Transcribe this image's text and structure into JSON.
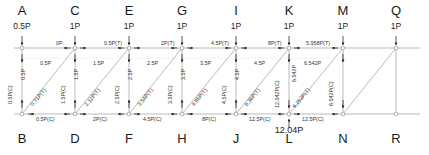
{
  "diagram": {
    "type": "truss-force-diagram",
    "panel_width": 53.5,
    "top_chord_y": 48,
    "bottom_chord_y": 114,
    "colors": {
      "member": "#9a9a9a",
      "text": "#2b2b2b",
      "arrow": "#222222"
    }
  },
  "top_nodes": [
    {
      "id": "A",
      "letter": "A",
      "load": "0.5P",
      "x": 22
    },
    {
      "id": "C",
      "letter": "C",
      "load": "1P",
      "x": 75
    },
    {
      "id": "E",
      "letter": "E",
      "load": "1P",
      "x": 129
    },
    {
      "id": "G",
      "letter": "G",
      "load": "1P",
      "x": 182
    },
    {
      "id": "I",
      "letter": "I",
      "load": "1P",
      "x": 236
    },
    {
      "id": "K",
      "letter": "K",
      "load": "1P",
      "x": 289
    },
    {
      "id": "M",
      "letter": "M",
      "load": "1P",
      "x": 343
    },
    {
      "id": "Q",
      "letter": "Q",
      "load": "1P",
      "x": 396
    }
  ],
  "bottom_nodes": [
    {
      "id": "B",
      "letter": "B",
      "x": 22
    },
    {
      "id": "D",
      "letter": "D",
      "x": 75
    },
    {
      "id": "F",
      "letter": "F",
      "x": 129
    },
    {
      "id": "H",
      "letter": "H",
      "x": 182
    },
    {
      "id": "J",
      "letter": "J",
      "x": 236
    },
    {
      "id": "L",
      "letter": "L",
      "x": 289
    },
    {
      "id": "N",
      "letter": "N",
      "x": 343
    },
    {
      "id": "R",
      "letter": "R",
      "x": 396
    }
  ],
  "top_chord_forces": [
    {
      "from": "A",
      "to": "C",
      "label": "0P",
      "x": 56,
      "y": 43
    },
    {
      "from": "C",
      "to": "E",
      "label": "0.5P(T)",
      "x": 107,
      "y": 43
    },
    {
      "from": "E",
      "to": "G",
      "label": "2P(T)",
      "x": 163,
      "y": 43
    },
    {
      "from": "G",
      "to": "I",
      "label": "4.5P(T)",
      "x": 213,
      "y": 43
    },
    {
      "from": "I",
      "to": "K",
      "label": "8P(T)",
      "x": 268,
      "y": 43
    },
    {
      "from": "K",
      "to": "M",
      "label": "5.958P(T)",
      "x": 313,
      "y": 43
    }
  ],
  "bottom_chord_forces": [
    {
      "from": "B",
      "to": "D",
      "label": "0.5P(C)",
      "x": 54,
      "y": 117
    },
    {
      "from": "D",
      "to": "F",
      "label": "2P(C)",
      "x": 110,
      "y": 117
    },
    {
      "from": "F",
      "to": "H",
      "label": "4.5P(C)",
      "x": 160,
      "y": 117
    },
    {
      "from": "H",
      "to": "J",
      "label": "8P(C)",
      "x": 216,
      "y": 117
    },
    {
      "from": "J",
      "to": "L",
      "label": "12.5P(C)",
      "x": 256,
      "y": 117
    },
    {
      "from": "L",
      "to": "N",
      "label": "12.5P(C)",
      "x": 310,
      "y": 117
    }
  ],
  "vertical_forces": [
    {
      "from": "A",
      "to": "B",
      "label": "0.5P(C)",
      "x": 11,
      "y": 103
    },
    {
      "from": "C",
      "to": "D",
      "label": "1.5P(C)",
      "x": 65,
      "y": 103
    },
    {
      "from": "E",
      "to": "F",
      "label": "2.5P(C)",
      "x": 118,
      "y": 103
    },
    {
      "from": "G",
      "to": "H",
      "label": "3.5P(C)",
      "x": 172,
      "y": 103
    },
    {
      "from": "I",
      "to": "J",
      "label": "4.5P(C)",
      "x": 225,
      "y": 103
    },
    {
      "from": "K",
      "to": "L",
      "label": "12.042P(C)",
      "x": 279,
      "y": 108
    },
    {
      "from": "M",
      "to": "N",
      "label": "6.542P(C)",
      "x": 333,
      "y": 105
    }
  ],
  "diagonal_forces": [
    {
      "from": "B",
      "to": "C",
      "label": "0.71P(T)",
      "x": 37,
      "y": 106
    },
    {
      "from": "D",
      "to": "E",
      "label": "2.12P(T)",
      "x": 90,
      "y": 106
    },
    {
      "from": "F",
      "to": "G",
      "label": "3.54P(T)",
      "x": 144,
      "y": 106
    },
    {
      "from": "H",
      "to": "I",
      "label": "4.95P(T)",
      "x": 197,
      "y": 106
    },
    {
      "from": "J",
      "to": "K",
      "label": "6.36P(T)",
      "x": 251,
      "y": 106
    },
    {
      "from": "L",
      "to": "M",
      "label": "9.252P(T)",
      "x": 298,
      "y": 106
    }
  ],
  "panel_dimensions": [
    {
      "label": "0.5P",
      "x": 45,
      "y": 63
    },
    {
      "label": "0.5P",
      "x": 26,
      "y": 66
    },
    {
      "label": "1.5P",
      "x": 98,
      "y": 63
    },
    {
      "label": "1.5P",
      "x": 79,
      "y": 66
    },
    {
      "label": "2.5P",
      "x": 152,
      "y": 63
    },
    {
      "label": "2.5P",
      "x": 133,
      "y": 66
    },
    {
      "label": "3.5P",
      "x": 205,
      "y": 63
    },
    {
      "label": "3.5P",
      "x": 186,
      "y": 66
    },
    {
      "label": "4.5P",
      "x": 259,
      "y": 63
    },
    {
      "label": "4.5P",
      "x": 240,
      "y": 66
    },
    {
      "label": "6.542P",
      "x": 310,
      "y": 63
    },
    {
      "label": "6.542P",
      "x": 297,
      "y": 66
    }
  ],
  "support_reaction": {
    "node": "L",
    "label": "12.04P",
    "x": 264,
    "y": 129
  }
}
